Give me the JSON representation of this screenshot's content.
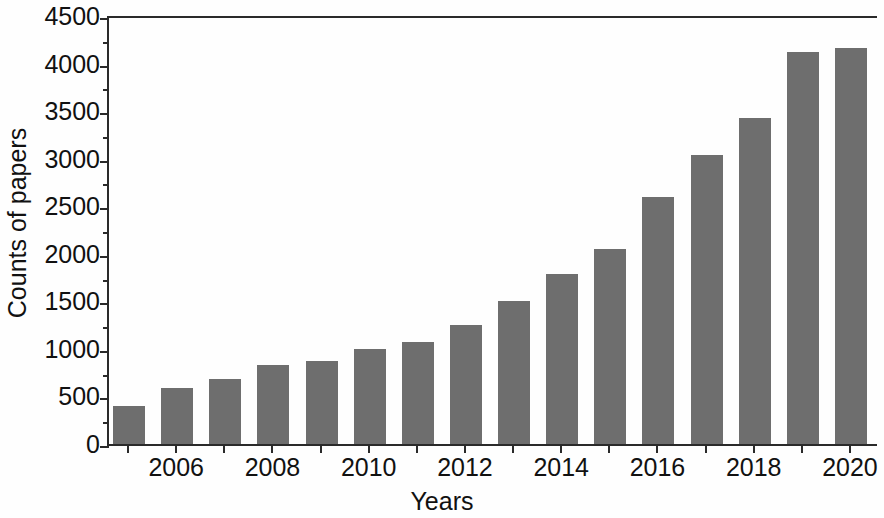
{
  "chart_data": {
    "type": "bar",
    "title": "",
    "xlabel": "Years",
    "ylabel": "Counts of papers",
    "categories": [
      2005,
      2006,
      2007,
      2008,
      2009,
      2010,
      2011,
      2012,
      2013,
      2014,
      2015,
      2016,
      2017,
      2018,
      2019,
      2020
    ],
    "values": [
      420,
      610,
      700,
      850,
      890,
      1020,
      1090,
      1270,
      1520,
      1810,
      2070,
      2620,
      3060,
      3450,
      4140,
      4190
    ],
    "series": [
      {
        "name": "Counts of papers",
        "values": [
          420,
          610,
          700,
          850,
          890,
          1020,
          1090,
          1270,
          1520,
          1810,
          2070,
          2620,
          3060,
          3450,
          4140,
          4190
        ]
      }
    ],
    "ylim": [
      0,
      4500
    ],
    "y_major_ticks": [
      0,
      500,
      1000,
      1500,
      2000,
      2500,
      3000,
      3500,
      4000,
      4500
    ],
    "y_minor_tick_interval": 250,
    "y_ticklabels": [
      "0",
      "500",
      "1000",
      "1500",
      "2000",
      "2500",
      "3000",
      "3500",
      "4000",
      "4500"
    ],
    "x_ticklabels": [
      "2006",
      "2008",
      "2010",
      "2012",
      "2014",
      "2016",
      "2018",
      "2020"
    ],
    "x_labelled_years": [
      2006,
      2008,
      2010,
      2012,
      2014,
      2016,
      2018,
      2020
    ],
    "grid": false,
    "legend": null,
    "bar_color": "#6e6e6e",
    "axis_color": "#2a2a2a",
    "background_color": "#ffffff"
  }
}
